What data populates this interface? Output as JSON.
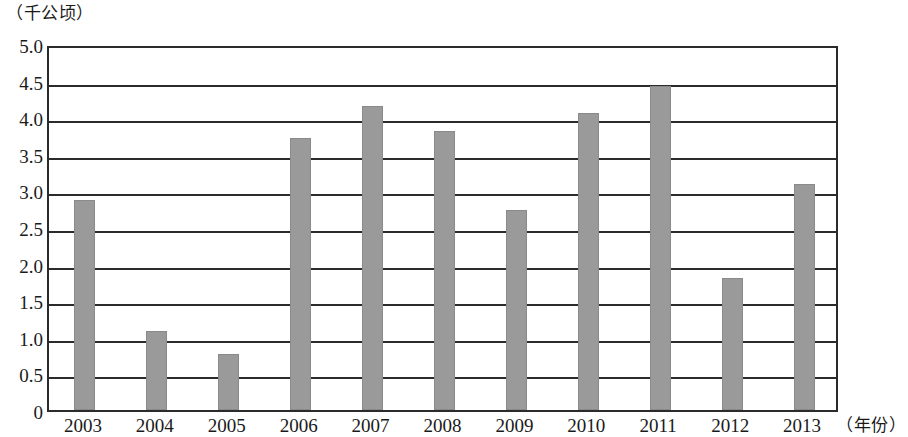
{
  "chart_data": {
    "type": "bar",
    "title": "",
    "subtitle": "",
    "xlabel": "（年份）",
    "ylabel": "（千公顷）",
    "unit_caption": "（千公顷）",
    "categories": [
      "2003",
      "2004",
      "2005",
      "2006",
      "2007",
      "2008",
      "2009",
      "2010",
      "2011",
      "2012",
      "2013"
    ],
    "values": [
      2.87,
      1.08,
      0.76,
      3.71,
      4.16,
      3.81,
      2.73,
      4.06,
      4.43,
      1.8,
      3.09
    ],
    "series": [
      {
        "name": "",
        "values": [
          2.87,
          1.08,
          0.76,
          3.71,
          4.16,
          3.81,
          2.73,
          4.06,
          4.43,
          1.8,
          3.09
        ]
      }
    ],
    "ylim": [
      0,
      5.0
    ],
    "ytick_values": [
      0,
      0.5,
      1.0,
      1.5,
      2.0,
      2.5,
      3.0,
      3.5,
      4.0,
      4.5,
      5.0
    ],
    "ytick_labels": [
      "0",
      "0.5",
      "1.0",
      "1.5",
      "2.0",
      "2.5",
      "3.0",
      "3.5",
      "4.0",
      "4.5",
      "5.0"
    ],
    "grid": true,
    "grid_axis": "y",
    "legend": false,
    "legend_position": "none",
    "bar_color": "#9a9a9a",
    "bar_border_color": "#8a8a8a",
    "axis_color": "#2b2b2b",
    "background_color": "#ffffff"
  }
}
